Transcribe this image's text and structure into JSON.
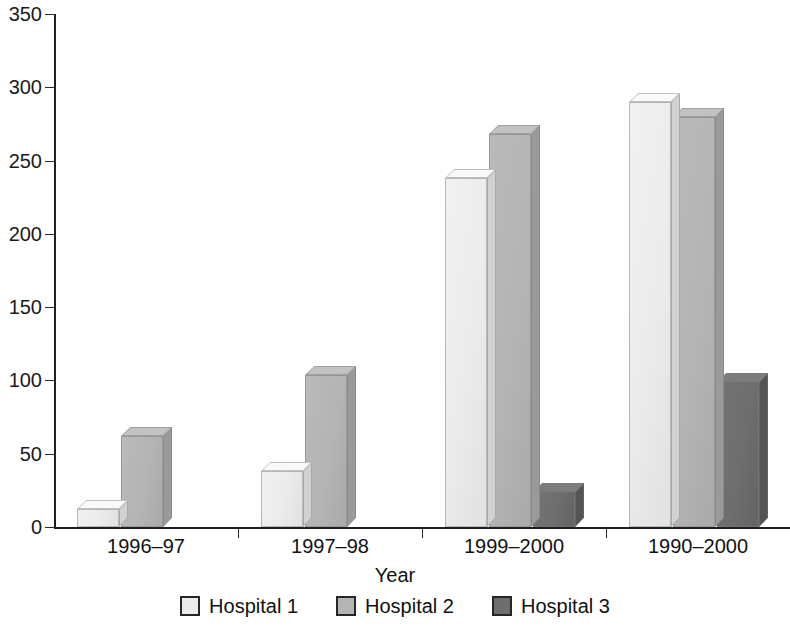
{
  "chart_data": {
    "type": "bar",
    "title": "",
    "subtitle": "",
    "xlabel": "Year",
    "ylabel": "",
    "categories": [
      "1996–97",
      "1997–98",
      "1999–2000",
      "1990–2000"
    ],
    "series": [
      {
        "name": "Hospital 1",
        "color": "#ebebeb",
        "values": [
          12,
          38,
          238,
          290
        ]
      },
      {
        "name": "Hospital 2",
        "color": "#b4b4b4",
        "values": [
          62,
          104,
          268,
          280
        ]
      },
      {
        "name": "Hospital 3",
        "color": "#6e6e6e",
        "values": [
          0,
          0,
          24,
          99
        ]
      }
    ],
    "ylim": [
      0,
      350
    ],
    "yticks": [
      0,
      50,
      100,
      150,
      200,
      250,
      300,
      350
    ],
    "ytick_labels": [
      "0",
      "50",
      "100",
      "150",
      "200",
      "250",
      "300",
      "350"
    ],
    "grid": false,
    "legend_position": "bottom",
    "style": "3d-bars"
  },
  "axis": {
    "y_labels": [
      "350",
      "300",
      "250",
      "200",
      "150",
      "100",
      "50",
      "0"
    ],
    "x_labels": [
      "1996–97",
      "1997–98",
      "1999–2000",
      "1990–2000"
    ],
    "x_title": "Year"
  },
  "legend": {
    "items": [
      {
        "label": "Hospital 1",
        "color": "#ebebeb"
      },
      {
        "label": "Hospital 2",
        "color": "#b4b4b4"
      },
      {
        "label": "Hospital 3",
        "color": "#6e6e6e"
      }
    ]
  },
  "colors": {
    "axis": "#1f1f1f",
    "text": "#111111",
    "background": "#ffffff",
    "hospital1": "#ebebeb",
    "hospital2": "#b4b4b4",
    "hospital3": "#6e6e6e"
  }
}
